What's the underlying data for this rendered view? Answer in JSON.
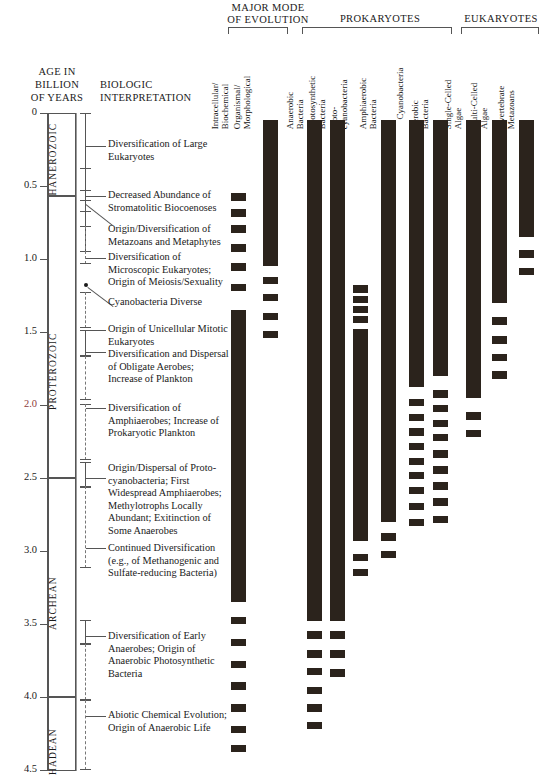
{
  "figure": {
    "axis_header": [
      "AGE IN",
      "BILLION",
      "OF YEARS"
    ],
    "interpretation_header": [
      "BIOLOGIC",
      "INTERPRETATION"
    ],
    "bar_color": "#2b231c",
    "accent_color": "#8d3b3b",
    "rule_color": "#555555"
  },
  "group_headers": [
    {
      "label": "MAJOR MODE\nOF EVOLUTION",
      "line1": "MAJOR MODE",
      "line2": "OF EVOLUTION"
    },
    {
      "label": "PROKARYOTES",
      "line1": "PROKARYOTES",
      "line2": ""
    },
    {
      "label": "EUKARYOTES",
      "line1": "EUKARYOTES",
      "line2": ""
    }
  ],
  "columns": [
    {
      "id": "intracellular-biochemical",
      "group": "MAJOR MODE OF EVOLUTION",
      "line1": "Intracellular/",
      "line2": "Biochemical"
    },
    {
      "id": "organismal-morphological",
      "group": "MAJOR MODE OF EVOLUTION",
      "line1": "Organismal/",
      "line2": "Morphological"
    },
    {
      "id": "anaerobic-bacteria",
      "group": "PROKARYOTES",
      "line1": "Anaerobic",
      "line2": "Bacteria"
    },
    {
      "id": "photosynthetic-bacteria",
      "group": "PROKARYOTES",
      "line1": "Photosynthetic",
      "line2": "Bacteria"
    },
    {
      "id": "proto-cyanobacteria",
      "group": "PROKARYOTES",
      "line1": "Proto-",
      "line2": "cyanobacteria"
    },
    {
      "id": "amphiaerobic-bacteria",
      "group": "PROKARYOTES",
      "line1": "Amphiaerobic",
      "line2": "Bacteria"
    },
    {
      "id": "cyanobacteria",
      "group": "PROKARYOTES",
      "line1": "Cyanobacteria",
      "line2": ""
    },
    {
      "id": "aerobic-bacteria",
      "group": "PROKARYOTES",
      "line1": "Aerobic",
      "line2": "Bacteria"
    },
    {
      "id": "single-celled-algae",
      "group": "EUKARYOTES",
      "line1": "Single-Celled",
      "line2": "Algae"
    },
    {
      "id": "multi-celled-algae",
      "group": "EUKARYOTES",
      "line1": "Multi-Celled",
      "line2": "Algae"
    },
    {
      "id": "invertebrate-metazoans",
      "group": "EUKARYOTES",
      "line1": "Invertebrate",
      "line2": "Metazoans"
    }
  ],
  "axis": {
    "ticks": [
      "0",
      "0.5",
      "1.0",
      "1.5",
      "2.0",
      "2.5",
      "3.0",
      "3.5",
      "4.0",
      "4.5"
    ],
    "tick_values": [
      0,
      0.5,
      1.0,
      1.5,
      2.0,
      2.5,
      3.0,
      3.5,
      4.0,
      4.5
    ],
    "accent_tick": "2.0",
    "unit": "billion years"
  },
  "eras": [
    {
      "name": "PHANEROZOIC",
      "from": 0.0,
      "to": 0.57
    },
    {
      "name": "PROTEROZOIC",
      "from": 0.57,
      "to": 2.5
    },
    {
      "name": "ARCHEAN",
      "from": 2.5,
      "to": 4.0
    },
    {
      "name": "HADEAN",
      "from": 4.0,
      "to": 4.5
    }
  ],
  "events": [
    {
      "id": "ev1",
      "text": "Diversification of Large\nEukaryotes",
      "lines": [
        "Diversification of Large",
        "Eukaryotes"
      ]
    },
    {
      "id": "ev2",
      "text": "Decreased Abundance of\nStromatolitic Biocoenoses",
      "lines": [
        "Decreased Abundance of",
        "Stromatolitic Biocoenoses"
      ]
    },
    {
      "id": "ev3",
      "text": "Origin/Diversification of\nMetazoans and Metaphytes",
      "lines": [
        "Origin/Diversification of",
        "Metazoans and Metaphytes"
      ]
    },
    {
      "id": "ev4",
      "text": "Diversification of\nMicroscopic Eukaryotes;\nOrigin of Meiosis/Sexuality",
      "lines": [
        "Diversification of",
        "Microscopic Eukaryotes;",
        "Origin of Meiosis/Sexuality"
      ]
    },
    {
      "id": "ev5",
      "text": "Cyanobacteria Diverse",
      "lines": [
        "Cyanobacteria Diverse"
      ]
    },
    {
      "id": "ev6",
      "text": "Origin of Unicellular Mitotic\nEukaryotes",
      "lines": [
        "Origin of Unicellular Mitotic",
        "Eukaryotes"
      ]
    },
    {
      "id": "ev7",
      "text": "Diversification and Dispersal\nof Obligate Aerobes;\nIncrease of Plankton",
      "lines": [
        "Diversification and Dispersal",
        "of Obligate Aerobes;",
        "Increase of Plankton"
      ]
    },
    {
      "id": "ev8",
      "text": "Diversification of\nAmphiaerobes; Increase of\nProkaryotic Plankton",
      "lines": [
        "Diversification of",
        "Amphiaerobes; Increase of",
        "Prokaryotic Plankton"
      ]
    },
    {
      "id": "ev9",
      "text": "Origin/Dispersal of Proto-\ncyanobacteria; First\nWidespread Amphiaerobes;\nMethylotrophs Locally\nAbundant; Exitinction of\nSome Anaerobes",
      "lines": [
        "Origin/Dispersal of Proto-",
        "cyanobacteria; First",
        "Widespread Amphiaerobes;",
        "Methylotrophs Locally",
        "Abundant; Exitinction of",
        "Some Anaerobes"
      ]
    },
    {
      "id": "ev10",
      "text": "Continued Diversification\n(e.g., of Methanogenic and\nSulfate-reducing Bacteria)",
      "lines": [
        "Continued Diversification",
        "(e.g., of Methanogenic and",
        "Sulfate-reducing Bacteria)"
      ]
    },
    {
      "id": "ev11",
      "text": "Diversification of Early\nAnaerobes; Origin of\nAnaerobic Photosynthetic\nBacteria",
      "lines": [
        "Diversification of Early",
        "Anaerobes; Origin of",
        "Anaerobic Photosynthetic",
        "Bacteria"
      ]
    },
    {
      "id": "ev12",
      "text": "Abiotic Chemical Evolution;\nOrigin of Anaerobic Life",
      "lines": [
        "Abiotic Chemical Evolution;",
        "Origin of Anaerobic Life"
      ]
    }
  ],
  "chart_data": {
    "type": "bar",
    "orientation": "vertical-time",
    "xlabel": "Biologic group / mode of evolution",
    "ylabel": "AGE IN BILLION OF YEARS",
    "ylim": [
      0,
      4.5
    ],
    "y_inverted": true,
    "grid": false,
    "legend": "none",
    "note": "Solid bars = continuous record; stacked short segments = intermittent / uncertain record",
    "categories": [
      "Intracellular/Biochemical",
      "Organismal/Morphological",
      "Anaerobic Bacteria",
      "Photosynthetic Bacteria",
      "Proto-cyanobacteria",
      "Amphiaerobic Bacteria",
      "Cyanobacteria",
      "Aerobic Bacteria",
      "Single-Celled Algae",
      "Multi-Celled Algae",
      "Invertebrate Metazoans"
    ],
    "series": [
      {
        "name": "Intracellular/Biochemical",
        "solid_range": [
          1.35,
          3.35
        ],
        "dashed_segments": [
          [
            0.55,
            0.6
          ],
          [
            0.66,
            0.71
          ],
          [
            0.77,
            0.82
          ],
          [
            0.9,
            0.95
          ],
          [
            1.03,
            1.08
          ],
          [
            1.17,
            1.22
          ],
          [
            3.45,
            3.5
          ],
          [
            3.6,
            3.65
          ],
          [
            3.75,
            3.8
          ],
          [
            3.9,
            3.95
          ],
          [
            4.05,
            4.1
          ],
          [
            4.2,
            4.25
          ],
          [
            4.33,
            4.38
          ]
        ]
      },
      {
        "name": "Organismal/Morphological",
        "solid_range": [
          0.05,
          1.05
        ],
        "dashed_segments": [
          [
            1.12,
            1.17
          ],
          [
            1.24,
            1.29
          ],
          [
            1.37,
            1.42
          ],
          [
            1.49,
            1.54
          ]
        ]
      },
      {
        "name": "Anaerobic Bacteria",
        "solid_range": [
          0.05,
          3.48
        ],
        "dashed_segments": [
          [
            3.55,
            3.6
          ],
          [
            3.68,
            3.73
          ],
          [
            3.8,
            3.85
          ],
          [
            3.93,
            3.98
          ],
          [
            4.05,
            4.1
          ],
          [
            4.17,
            4.22
          ]
        ]
      },
      {
        "name": "Photosynthetic Bacteria",
        "solid_range": [
          0.05,
          3.48
        ],
        "dashed_segments": [
          [
            3.55,
            3.6
          ],
          [
            3.68,
            3.73
          ],
          [
            3.81,
            3.86
          ]
        ]
      },
      {
        "name": "Proto-cyanobacteria",
        "solid_range": [
          1.48,
          2.93
        ],
        "dashed_segments": [
          [
            1.18,
            1.23
          ],
          [
            1.25,
            1.3
          ],
          [
            1.32,
            1.37
          ],
          [
            1.39,
            1.44
          ],
          [
            3.02,
            3.07
          ],
          [
            3.12,
            3.17
          ]
        ]
      },
      {
        "name": "Amphiaerobic Bacteria",
        "solid_range": [
          0.05,
          2.8
        ],
        "dashed_segments": [
          [
            2.88,
            2.93
          ],
          [
            3.0,
            3.05
          ]
        ]
      },
      {
        "name": "Cyanobacteria",
        "solid_range": [
          0.05,
          1.88
        ],
        "dashed_segments": [
          [
            1.96,
            2.01
          ],
          [
            2.06,
            2.11
          ],
          [
            2.16,
            2.21
          ],
          [
            2.26,
            2.31
          ],
          [
            2.36,
            2.41
          ],
          [
            2.46,
            2.51
          ],
          [
            2.56,
            2.61
          ],
          [
            2.67,
            2.72
          ],
          [
            2.78,
            2.83
          ]
        ]
      },
      {
        "name": "Aerobic Bacteria",
        "solid_range": [
          0.05,
          1.8
        ],
        "dashed_segments": [
          [
            1.9,
            1.95
          ],
          [
            2.0,
            2.05
          ],
          [
            2.1,
            2.15
          ],
          [
            2.2,
            2.25
          ],
          [
            2.31,
            2.36
          ],
          [
            2.42,
            2.47
          ],
          [
            2.53,
            2.58
          ],
          [
            2.64,
            2.69
          ],
          [
            2.76,
            2.81
          ]
        ]
      },
      {
        "name": "Single-Celled Algae",
        "solid_range": [
          0.05,
          1.95
        ],
        "dashed_segments": [
          [
            2.05,
            2.1
          ],
          [
            2.17,
            2.22
          ]
        ]
      },
      {
        "name": "Multi-Celled Algae",
        "solid_range": [
          0.05,
          1.3
        ],
        "dashed_segments": [
          [
            1.4,
            1.45
          ],
          [
            1.53,
            1.58
          ],
          [
            1.65,
            1.7
          ],
          [
            1.77,
            1.82
          ]
        ]
      },
      {
        "name": "Invertebrate Metazoans",
        "solid_range": [
          0.05,
          0.85
        ],
        "dashed_segments": [
          [
            0.94,
            0.99
          ],
          [
            1.06,
            1.11
          ]
        ]
      }
    ]
  }
}
